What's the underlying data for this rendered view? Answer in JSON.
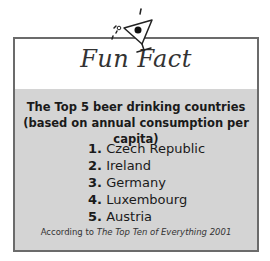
{
  "title": "Fun Fact",
  "heading_line1": "The Top 5 beer drinking countries",
  "heading_line2": "(based on annual consumption per capita)",
  "items": [
    {
      "num": "1.",
      "label": "Czech Republic"
    },
    {
      "num": "2.",
      "label": "Ireland"
    },
    {
      "num": "3.",
      "label": "Germany"
    },
    {
      "num": "4.",
      "label": "Luxembourg"
    },
    {
      "num": "5.",
      "label": "Austria"
    }
  ],
  "source_prefix": "According to ",
  "source_title": "The Top Ten of Everything 2001",
  "icon": "martini-glass-icon"
}
